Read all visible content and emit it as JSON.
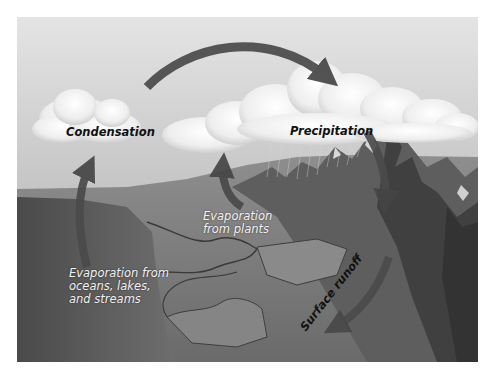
{
  "diagram": {
    "type": "water-cycle",
    "palette": {
      "arrow": "#4a4a4a",
      "sky_top": "#cfcfcf",
      "sky_bottom": "#a8a8a8",
      "cloud": "#f4f4f4",
      "land": "#7a7a7a",
      "mountain": "#5b5b5b",
      "label_dark": "#111111",
      "label_light": "#f2f2f2"
    },
    "labels": {
      "condensation": "Condensation",
      "precipitation": "Precipitation",
      "evaporation_plants_line1": "Evaporation",
      "evaporation_plants_line2": "from plants",
      "evaporation_water_line1": "Evaporation from",
      "evaporation_water_line2": "oceans, lakes,",
      "evaporation_water_line3": "and streams",
      "surface_runoff": "Surface runoff"
    },
    "arrows": [
      {
        "name": "condensation-to-precipitation",
        "from": "Condensation",
        "to": "Precipitation"
      },
      {
        "name": "precipitation-to-mountains",
        "from": "Precipitation",
        "to": "Mountains"
      },
      {
        "name": "surface-runoff",
        "from": "Mountains",
        "to": "Lowlands"
      },
      {
        "name": "evaporation-from-water",
        "from": "Oceans, lakes, and streams",
        "to": "Condensation"
      },
      {
        "name": "evaporation-from-plants",
        "from": "Plants",
        "to": "Clouds"
      }
    ]
  }
}
